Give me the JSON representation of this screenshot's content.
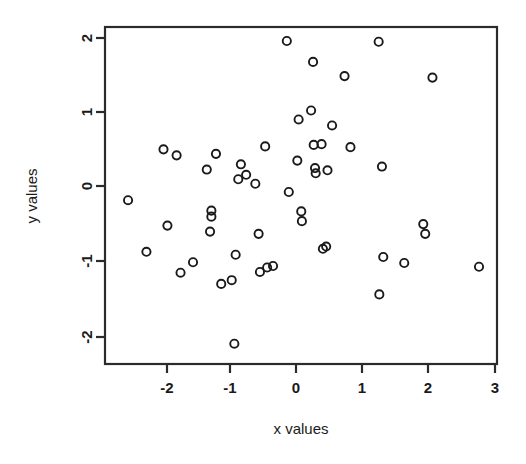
{
  "chart_data": {
    "type": "scatter",
    "title": "",
    "xlabel": "x values",
    "ylabel": "y values",
    "xlim": [
      -2.85,
      3.05
    ],
    "ylim": [
      -2.25,
      2.1
    ],
    "xticks": [
      -2,
      -1,
      0,
      1,
      2,
      3
    ],
    "xticklabels": [
      "-2",
      "-1",
      "0",
      "1",
      "2",
      "3"
    ],
    "yticks": [
      -2,
      -1,
      0,
      1,
      2
    ],
    "yticklabels": [
      "-2",
      "-1",
      "0",
      "1",
      "2"
    ],
    "grid": false,
    "legend": null,
    "marker": "open-circle",
    "marker_color": "#1a1a1a",
    "n_points": 62,
    "points": [
      {
        "x": -2.56,
        "y": -0.19
      },
      {
        "x": -2.28,
        "y": -0.88
      },
      {
        "x": -2.02,
        "y": 0.49
      },
      {
        "x": -1.96,
        "y": -0.53
      },
      {
        "x": -1.82,
        "y": 0.41
      },
      {
        "x": -1.76,
        "y": -1.16
      },
      {
        "x": -1.57,
        "y": -1.02
      },
      {
        "x": -1.36,
        "y": 0.22
      },
      {
        "x": -1.29,
        "y": -0.33
      },
      {
        "x": -1.29,
        "y": -0.41
      },
      {
        "x": -1.31,
        "y": -0.61
      },
      {
        "x": -1.22,
        "y": 0.43
      },
      {
        "x": -1.14,
        "y": -1.31
      },
      {
        "x": -0.98,
        "y": -1.26
      },
      {
        "x": -0.94,
        "y": -2.11
      },
      {
        "x": -0.92,
        "y": -0.92
      },
      {
        "x": -0.88,
        "y": 0.09
      },
      {
        "x": -0.84,
        "y": 0.29
      },
      {
        "x": -0.76,
        "y": 0.15
      },
      {
        "x": -0.62,
        "y": 0.03
      },
      {
        "x": -0.57,
        "y": -0.64
      },
      {
        "x": -0.55,
        "y": -1.15
      },
      {
        "x": -0.47,
        "y": 0.53
      },
      {
        "x": -0.44,
        "y": -1.09
      },
      {
        "x": -0.35,
        "y": -1.07
      },
      {
        "x": -0.14,
        "y": 1.94
      },
      {
        "x": -0.11,
        "y": -0.08
      },
      {
        "x": 0.02,
        "y": 0.34
      },
      {
        "x": 0.04,
        "y": 0.89
      },
      {
        "x": 0.08,
        "y": -0.34
      },
      {
        "x": 0.09,
        "y": -0.47
      },
      {
        "x": 0.23,
        "y": 1.01
      },
      {
        "x": 0.26,
        "y": 1.66
      },
      {
        "x": 0.27,
        "y": 0.55
      },
      {
        "x": 0.29,
        "y": 0.24
      },
      {
        "x": 0.3,
        "y": 0.17
      },
      {
        "x": 0.39,
        "y": 0.56
      },
      {
        "x": 0.41,
        "y": -0.84
      },
      {
        "x": 0.46,
        "y": -0.81
      },
      {
        "x": 0.48,
        "y": 0.21
      },
      {
        "x": 0.55,
        "y": 0.81
      },
      {
        "x": 0.74,
        "y": 1.47
      },
      {
        "x": 0.83,
        "y": 0.52
      },
      {
        "x": 1.26,
        "y": 1.93
      },
      {
        "x": 1.27,
        "y": -1.45
      },
      {
        "x": 1.31,
        "y": 0.26
      },
      {
        "x": 1.33,
        "y": -0.95
      },
      {
        "x": 1.65,
        "y": -1.03
      },
      {
        "x": 1.94,
        "y": -0.51
      },
      {
        "x": 1.97,
        "y": -0.64
      },
      {
        "x": 2.08,
        "y": 1.45
      },
      {
        "x": 2.79,
        "y": -1.08
      }
    ]
  },
  "figure": {
    "background_color": "#ffffff",
    "frame_color": "#2b2b2b",
    "point_color": "#1a1a1a"
  }
}
